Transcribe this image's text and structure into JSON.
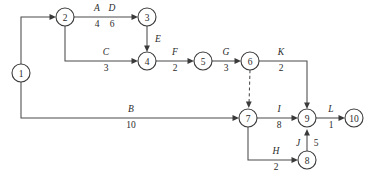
{
  "diagram": {
    "type": "activity-on-arrow-network",
    "background_color": "#ffffff",
    "line_color": "#4a4a4a",
    "text_color": "#2b2b2b",
    "nodes": [
      {
        "id": "1",
        "label": "1",
        "cx": 21,
        "cy": 73,
        "r": 9
      },
      {
        "id": "2",
        "label": "2",
        "cx": 65,
        "cy": 17,
        "r": 9
      },
      {
        "id": "3",
        "label": "3",
        "cx": 147,
        "cy": 17,
        "r": 9
      },
      {
        "id": "4",
        "label": "4",
        "cx": 147,
        "cy": 61,
        "r": 9
      },
      {
        "id": "5",
        "label": "5",
        "cx": 203,
        "cy": 61,
        "r": 9
      },
      {
        "id": "6",
        "label": "6",
        "cx": 250,
        "cy": 61,
        "r": 9
      },
      {
        "id": "7",
        "label": "7",
        "cx": 248,
        "cy": 118,
        "r": 9
      },
      {
        "id": "8",
        "label": "8",
        "cx": 307,
        "cy": 160,
        "r": 9
      },
      {
        "id": "9",
        "label": "9",
        "cx": 307,
        "cy": 118,
        "r": 9
      },
      {
        "id": "10",
        "label": "10",
        "cx": 354,
        "cy": 118,
        "r": 9
      }
    ],
    "edges": [
      {
        "id": "A",
        "name": "A",
        "duration": "4",
        "from": "1",
        "to": "2",
        "style": "solid",
        "label_x": 97,
        "label_name_y": 11,
        "label_dur_y": 25
      },
      {
        "id": "D",
        "name": "D",
        "duration": "6",
        "from": "2",
        "to": "3",
        "style": "solid",
        "label_x": 106,
        "label_name_y": 11,
        "label_dur_y": 25
      },
      {
        "id": "C",
        "name": "C",
        "duration": "3",
        "from": "2",
        "to": "4",
        "style": "solid",
        "label_x": 106,
        "label_name_y": 55,
        "label_dur_y": 69
      },
      {
        "id": "E",
        "name": "E",
        "duration": "",
        "from": "3",
        "to": "4",
        "style": "solid",
        "label_x": 157,
        "label_name_y": 42,
        "label_dur_y": 0
      },
      {
        "id": "F",
        "name": "F",
        "duration": "2",
        "from": "4",
        "to": "5",
        "style": "solid",
        "label_x": 176,
        "label_name_y": 55,
        "label_dur_y": 69
      },
      {
        "id": "G",
        "name": "G",
        "duration": "3",
        "from": "5",
        "to": "6",
        "style": "solid",
        "label_x": 226,
        "label_name_y": 55,
        "label_dur_y": 69
      },
      {
        "id": "K",
        "name": "K",
        "duration": "2",
        "from": "6",
        "to": "9",
        "style": "solid",
        "label_x": 281,
        "label_name_y": 55,
        "label_dur_y": 69
      },
      {
        "id": "B",
        "name": "B",
        "duration": "10",
        "from": "1",
        "to": "7",
        "style": "solid",
        "label_x": 131,
        "label_name_y": 112,
        "label_dur_y": 126
      },
      {
        "id": "DUMMY",
        "name": "",
        "duration": "",
        "from": "6",
        "to": "7",
        "style": "dashed",
        "label_x": 0,
        "label_name_y": 0,
        "label_dur_y": 0
      },
      {
        "id": "I",
        "name": "I",
        "duration": "8",
        "from": "7",
        "to": "9",
        "style": "solid",
        "label_x": 279,
        "label_name_y": 112,
        "label_dur_y": 126
      },
      {
        "id": "L",
        "name": "L",
        "duration": "1",
        "from": "9",
        "to": "10",
        "style": "solid",
        "label_x": 331,
        "label_name_y": 112,
        "label_dur_y": 126
      },
      {
        "id": "H",
        "name": "H",
        "duration": "2",
        "from": "7",
        "to": "8",
        "style": "solid",
        "label_x": 276,
        "label_name_y": 154,
        "label_dur_y": 168
      },
      {
        "id": "J",
        "name": "J",
        "duration": "5",
        "from": "8",
        "to": "9",
        "style": "solid",
        "label_x": 299,
        "label_name_y": 143,
        "label_dur_y": 143
      }
    ]
  }
}
